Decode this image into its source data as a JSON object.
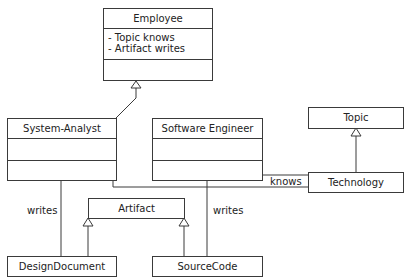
{
  "diagram": {
    "type": "UML class diagram",
    "classes": {
      "employee": {
        "name": "Employee",
        "attributes": [
          "- Topic knows",
          "- Artifact writes"
        ]
      },
      "system_analyst": {
        "name": "System-Analyst"
      },
      "software_engineer": {
        "name": "Software Engineer"
      },
      "topic": {
        "name": "Topic"
      },
      "technology": {
        "name": "Technology"
      },
      "artifact": {
        "name": "Artifact"
      },
      "design_document": {
        "name": "DesignDocument"
      },
      "source_code": {
        "name": "SourceCode"
      }
    },
    "labels": {
      "knows": "knows",
      "writes_left": "writes",
      "writes_right": "writes"
    },
    "relations": [
      {
        "from": "System-Analyst",
        "to": "Employee",
        "kind": "generalization"
      },
      {
        "from": "Technology",
        "to": "Topic",
        "kind": "generalization"
      },
      {
        "from": "DesignDocument",
        "to": "Artifact",
        "kind": "generalization"
      },
      {
        "from": "SourceCode",
        "to": "Artifact",
        "kind": "generalization"
      },
      {
        "from": "System-Analyst",
        "to": "DesignDocument",
        "kind": "association",
        "label": "writes"
      },
      {
        "from": "Software Engineer",
        "to": "SourceCode",
        "kind": "association",
        "label": "writes"
      },
      {
        "from": "Software Engineer",
        "to": "Technology",
        "kind": "association",
        "label": "knows"
      },
      {
        "from": "System-Analyst",
        "to": "Technology",
        "kind": "association",
        "label": "knows"
      }
    ],
    "colors": {
      "line": "#3a3a3a",
      "background": "#ffffff",
      "text": "#222222"
    }
  }
}
